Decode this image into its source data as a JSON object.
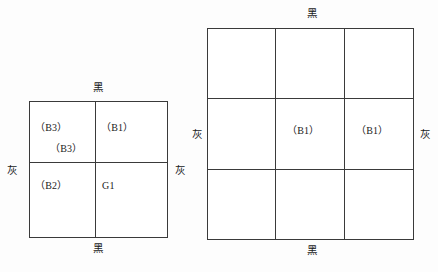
{
  "figure": {
    "background_color": "#fdfdfd",
    "line_color": "#3a3a3a",
    "text_color": "#1a1a1a"
  },
  "left_diagram": {
    "name": "two-by-two-grid",
    "rows": 2,
    "columns": 2,
    "edge_labels": {
      "top": "黑",
      "bottom": "黑",
      "left": "灰",
      "right": "灰"
    },
    "cells": [
      {
        "row": 0,
        "col": 0,
        "labels": [
          "（B3）",
          "（B3）"
        ]
      },
      {
        "row": 0,
        "col": 1,
        "labels": [
          "（B1）"
        ]
      },
      {
        "row": 1,
        "col": 0,
        "labels": [
          "（B2）"
        ]
      },
      {
        "row": 1,
        "col": 1,
        "labels": [
          "G1"
        ]
      }
    ]
  },
  "right_diagram": {
    "name": "three-by-three-grid",
    "rows": 3,
    "columns": 3,
    "edge_labels": {
      "top": "黑",
      "bottom": "黑",
      "left": "灰",
      "right": "灰"
    },
    "cells": [
      {
        "row": 0,
        "col": 0,
        "labels": []
      },
      {
        "row": 0,
        "col": 1,
        "labels": []
      },
      {
        "row": 0,
        "col": 2,
        "labels": []
      },
      {
        "row": 1,
        "col": 0,
        "labels": []
      },
      {
        "row": 1,
        "col": 1,
        "labels": [
          "（B1）"
        ]
      },
      {
        "row": 1,
        "col": 2,
        "labels": [
          "（B1）"
        ]
      },
      {
        "row": 2,
        "col": 0,
        "labels": []
      },
      {
        "row": 2,
        "col": 1,
        "labels": []
      },
      {
        "row": 2,
        "col": 2,
        "labels": []
      }
    ]
  }
}
